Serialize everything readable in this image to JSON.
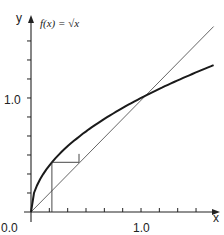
{
  "chart_data": {
    "type": "line",
    "title": "f(x) = √x",
    "xlabel": "x",
    "ylabel": "y",
    "xlim": [
      0,
      1.67
    ],
    "ylim": [
      0,
      1.67
    ],
    "x_tick_labels": [
      "0.0",
      "1.0"
    ],
    "y_tick_labels": [
      "1.0"
    ],
    "tick_step": 0.1667,
    "grid": false,
    "series": [
      {
        "name": "f(x) = √x",
        "style": "thick",
        "x": [
          0,
          0.05,
          0.1,
          0.2,
          0.3,
          0.5,
          0.75,
          1.0,
          1.25,
          1.5,
          1.66
        ],
        "y": [
          0,
          0.224,
          0.316,
          0.447,
          0.548,
          0.707,
          0.866,
          1.0,
          1.118,
          1.225,
          1.288
        ]
      },
      {
        "name": "y = x",
        "style": "thin",
        "x": [
          0,
          1.66
        ],
        "y": [
          0,
          1.66
        ]
      },
      {
        "name": "cobweb",
        "style": "thin",
        "points": [
          [
            0.19,
            0
          ],
          [
            0.19,
            0.436
          ],
          [
            0.436,
            0.436
          ],
          [
            0.436,
            0.51
          ]
        ]
      }
    ],
    "annotations": [
      "0.0",
      "1.0",
      "1.0",
      "x",
      "y"
    ]
  },
  "labels": {
    "title": "f(x) = √x",
    "x_axis": "x",
    "y_axis": "y",
    "origin": "0.0",
    "x_one": "1.0",
    "y_one": "1.0"
  },
  "colors": {
    "axis": "#222222",
    "curve": "#1a1a1a",
    "diagonal": "#555555"
  }
}
